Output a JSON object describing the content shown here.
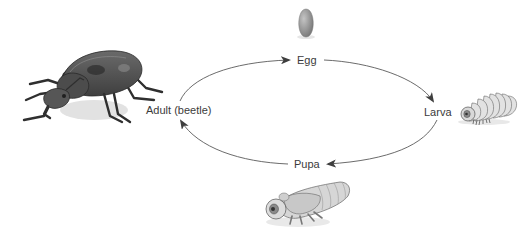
{
  "diagram": {
    "type": "cycle",
    "direction": "clockwise",
    "stages": [
      {
        "id": "egg",
        "label": "Egg",
        "icon": "egg-icon"
      },
      {
        "id": "larva",
        "label": "Larva",
        "icon": "larva-icon"
      },
      {
        "id": "pupa",
        "label": "Pupa",
        "icon": "pupa-icon"
      },
      {
        "id": "adult",
        "label": "Adult (beetle)",
        "icon": "beetle-icon"
      }
    ],
    "edges": [
      {
        "from": "adult",
        "to": "egg"
      },
      {
        "from": "egg",
        "to": "larva"
      },
      {
        "from": "larva",
        "to": "pupa"
      },
      {
        "from": "pupa",
        "to": "adult"
      }
    ],
    "colors": {
      "arrow": "#4a4a4a",
      "text": "#3b3b3b",
      "beetle_body": "#4f4f4f",
      "egg": "#8c8c8c",
      "larva": "#d9d9d9",
      "pupa": "#cfcfcf",
      "shadow": "#e4e4e4"
    }
  }
}
